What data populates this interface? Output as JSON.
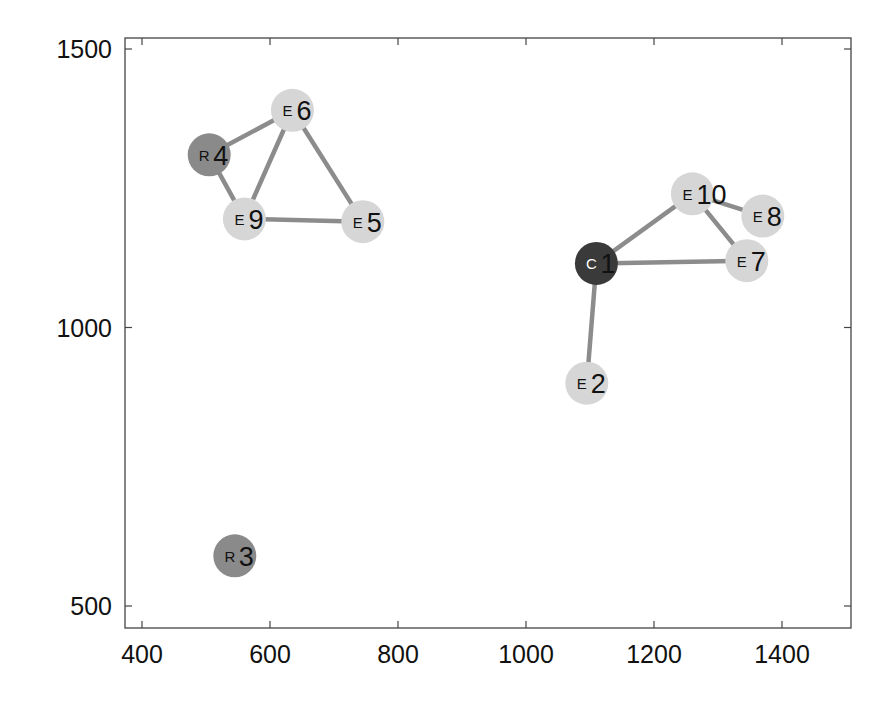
{
  "chart_data": {
    "type": "scatter",
    "subtype": "network-graph",
    "title": "",
    "xlabel": "",
    "ylabel": "",
    "xlim": [
      372,
      1480
    ],
    "ylim": [
      462,
      1520
    ],
    "x_ticks": [
      400,
      600,
      800,
      1000,
      1200,
      1400
    ],
    "y_ticks": [
      500,
      1000,
      1500
    ],
    "grid": false,
    "legend": null,
    "node_types": {
      "C": {
        "color": "#3a3a3a",
        "label_color": "#ffffff"
      },
      "R": {
        "color": "#8a8a8a",
        "label_color": "#111111"
      },
      "E": {
        "color": "#d6d6d6",
        "label_color": "#111111"
      }
    },
    "edge_color": "#8c8c8c",
    "nodes": [
      {
        "id": 1,
        "type": "C",
        "x": 1110,
        "y": 1115
      },
      {
        "id": 2,
        "type": "E",
        "x": 1095,
        "y": 900
      },
      {
        "id": 3,
        "type": "R",
        "x": 545,
        "y": 590
      },
      {
        "id": 4,
        "type": "R",
        "x": 505,
        "y": 1310
      },
      {
        "id": 5,
        "type": "E",
        "x": 745,
        "y": 1190
      },
      {
        "id": 6,
        "type": "E",
        "x": 635,
        "y": 1390
      },
      {
        "id": 7,
        "type": "E",
        "x": 1345,
        "y": 1120
      },
      {
        "id": 8,
        "type": "E",
        "x": 1370,
        "y": 1200
      },
      {
        "id": 9,
        "type": "E",
        "x": 560,
        "y": 1195
      },
      {
        "id": 10,
        "type": "E",
        "x": 1260,
        "y": 1240
      }
    ],
    "edges": [
      [
        4,
        6
      ],
      [
        4,
        9
      ],
      [
        6,
        9
      ],
      [
        6,
        5
      ],
      [
        9,
        5
      ],
      [
        1,
        10
      ],
      [
        1,
        7
      ],
      [
        1,
        2
      ],
      [
        10,
        7
      ],
      [
        10,
        8
      ]
    ]
  }
}
